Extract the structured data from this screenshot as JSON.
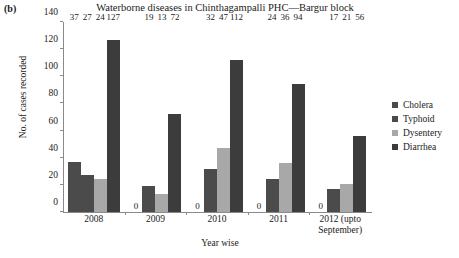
{
  "panel": "(b)",
  "chart_data": {
    "type": "bar",
    "title": "Waterborne diseases in Chinthagampalli PHC—Bargur block",
    "xlabel": "Year wise",
    "ylabel": "No. of cases recorded",
    "ylim": [
      0,
      140
    ],
    "yticks": [
      0,
      20,
      40,
      60,
      80,
      100,
      120,
      140
    ],
    "grid": false,
    "legend_position": "right",
    "categories": [
      "2008",
      "2009",
      "2010",
      "2011",
      "2012 (upto September)"
    ],
    "category_lines": [
      [
        "2008"
      ],
      [
        "2009"
      ],
      [
        "2010"
      ],
      [
        "2011"
      ],
      [
        "2012 (upto",
        "September)"
      ]
    ],
    "series": [
      {
        "name": "Cholera",
        "color": "#4b4b4b",
        "values": [
          37,
          0,
          0,
          0,
          0
        ]
      },
      {
        "name": "Typhoid",
        "color": "#4b4b4b",
        "values": [
          27,
          19,
          32,
          24,
          17
        ]
      },
      {
        "name": "Dysentery",
        "color": "#a8a8a8",
        "values": [
          24,
          13,
          47,
          36,
          21
        ]
      },
      {
        "name": "Diarrhea",
        "color": "#3c3c3c",
        "values": [
          127,
          72,
          112,
          94,
          56
        ]
      }
    ],
    "value_labels": [
      [
        "37",
        "27",
        "24",
        "127"
      ],
      [
        "0",
        "19",
        "13",
        "72"
      ],
      [
        "0",
        "32",
        "47",
        "112"
      ],
      [
        "0",
        "24",
        "36",
        "94"
      ],
      [
        "0",
        "17",
        "21",
        "56"
      ]
    ]
  },
  "colors": {
    "axis": "#8a8a8a",
    "text": "#1a1a1a",
    "background": "#ffffff"
  }
}
